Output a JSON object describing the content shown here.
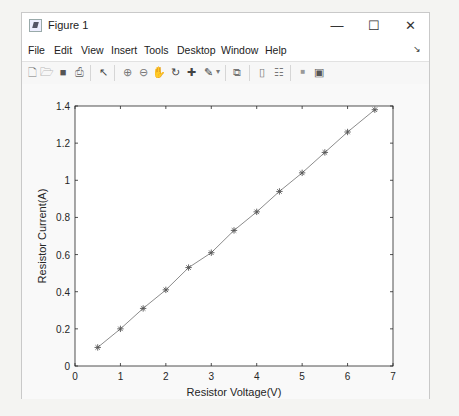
{
  "window": {
    "title": "Figure 1",
    "controls": {
      "minimize": "—",
      "maximize": "☐",
      "close": "✕"
    },
    "dock_arrow": "↘"
  },
  "menubar": {
    "items": [
      "File",
      "Edit",
      "View",
      "Insert",
      "Tools",
      "Desktop",
      "Window",
      "Help"
    ]
  },
  "toolbar": {
    "buttons": [
      {
        "name": "new-figure-icon",
        "glyph": "🗋"
      },
      {
        "name": "open-file-icon",
        "glyph": "🗁"
      },
      {
        "name": "save-icon",
        "glyph": "■"
      },
      {
        "name": "print-icon",
        "glyph": "⎙"
      },
      {
        "name": "select-arrow-icon",
        "glyph": "↖"
      },
      {
        "name": "zoom-in-icon",
        "glyph": "⊕"
      },
      {
        "name": "zoom-out-icon",
        "glyph": "⊖"
      },
      {
        "name": "pan-hand-icon",
        "glyph": "✋"
      },
      {
        "name": "rotate-3d-icon",
        "glyph": "↻"
      },
      {
        "name": "data-cursor-icon",
        "glyph": "✚"
      },
      {
        "name": "brush-icon",
        "glyph": "✎"
      },
      {
        "name": "brush-dropdown-icon",
        "glyph": "▾"
      },
      {
        "name": "link-plot-icon",
        "glyph": "⧉"
      },
      {
        "name": "insert-colorbar-icon",
        "glyph": "▯"
      },
      {
        "name": "insert-legend-icon",
        "glyph": "☷"
      },
      {
        "name": "hide-plot-tools-icon",
        "glyph": "■"
      },
      {
        "name": "show-plot-tools-icon",
        "glyph": "▣"
      }
    ]
  },
  "chart_data": {
    "type": "line",
    "title": "",
    "xlabel": "Resistor Voltage(V)",
    "ylabel": "Resistor Current(A)",
    "xlim": [
      0,
      7
    ],
    "ylim": [
      0,
      1.4
    ],
    "xticks": [
      "0",
      "1",
      "2",
      "3",
      "4",
      "5",
      "6",
      "7"
    ],
    "yticks": [
      "0",
      "0.2",
      "0.4",
      "0.6",
      "0.8",
      "1",
      "1.2",
      "1.4"
    ],
    "grid": false,
    "legend": null,
    "marker": "*",
    "line_color": "#8c8c8c",
    "marker_color": "#555555",
    "x": [
      0.5,
      1.0,
      1.5,
      2.0,
      2.5,
      3.0,
      3.5,
      4.0,
      4.5,
      5.0,
      5.5,
      6.0,
      6.6
    ],
    "y": [
      0.1,
      0.2,
      0.31,
      0.41,
      0.53,
      0.61,
      0.73,
      0.83,
      0.94,
      1.04,
      1.15,
      1.26,
      1.38
    ]
  }
}
